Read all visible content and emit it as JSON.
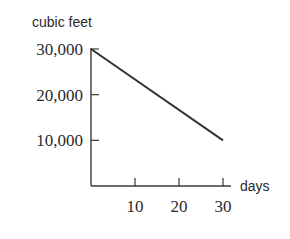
{
  "chart_data": {
    "type": "line",
    "title": "",
    "xlabel": "days",
    "ylabel": "cubic feet",
    "xlim": [
      0,
      30
    ],
    "ylim": [
      0,
      30000
    ],
    "x_ticks": [
      10,
      20,
      30
    ],
    "x_tick_labels": [
      "10",
      "20",
      "30"
    ],
    "y_ticks": [
      10000,
      20000,
      30000
    ],
    "y_tick_labels": [
      "10,000",
      "20,000",
      "30,000"
    ],
    "grid": false,
    "legend": "none",
    "series": [
      {
        "name": "volume",
        "x": [
          0,
          30
        ],
        "y": [
          30000,
          10000
        ]
      }
    ]
  }
}
